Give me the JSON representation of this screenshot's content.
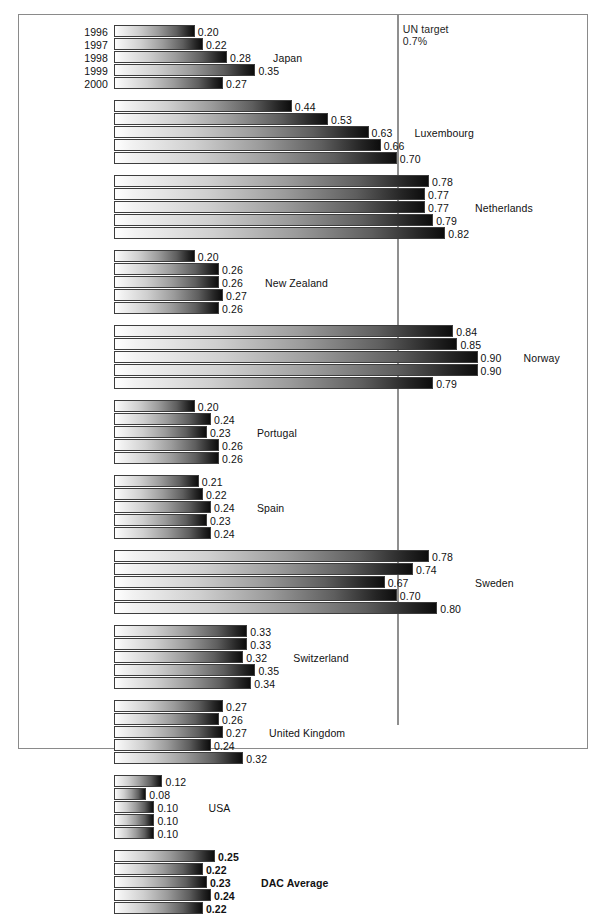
{
  "chart_data": {
    "type": "bar",
    "title": "",
    "xlabel": "",
    "ylabel": "",
    "orientation": "horizontal",
    "grid": false,
    "legend_position": "none",
    "xlim": [
      0,
      1.0
    ],
    "categories": [
      "1996",
      "1997",
      "1998",
      "1999",
      "2000"
    ],
    "reference_line": {
      "label": "UN target",
      "value_label": "0.7%",
      "value": 0.7
    },
    "series": [
      {
        "name": "Japan",
        "bold": false,
        "values": [
          0.2,
          0.22,
          0.28,
          0.35,
          0.27
        ]
      },
      {
        "name": "Luxembourg",
        "bold": false,
        "values": [
          0.44,
          0.53,
          0.63,
          0.66,
          0.7
        ]
      },
      {
        "name": "Netherlands",
        "bold": false,
        "values": [
          0.78,
          0.77,
          0.77,
          0.79,
          0.82
        ]
      },
      {
        "name": "New Zealand",
        "bold": false,
        "values": [
          0.2,
          0.26,
          0.26,
          0.27,
          0.26
        ]
      },
      {
        "name": "Norway",
        "bold": false,
        "values": [
          0.84,
          0.85,
          0.9,
          0.9,
          0.79
        ]
      },
      {
        "name": "Portugal",
        "bold": false,
        "values": [
          0.2,
          0.24,
          0.23,
          0.26,
          0.26
        ]
      },
      {
        "name": "Spain",
        "bold": false,
        "values": [
          0.21,
          0.22,
          0.24,
          0.23,
          0.24
        ]
      },
      {
        "name": "Sweden",
        "bold": false,
        "values": [
          0.78,
          0.74,
          0.67,
          0.7,
          0.8
        ]
      },
      {
        "name": "Switzerland",
        "bold": false,
        "values": [
          0.33,
          0.33,
          0.32,
          0.35,
          0.34
        ]
      },
      {
        "name": "United Kingdom",
        "bold": false,
        "values": [
          0.27,
          0.26,
          0.27,
          0.24,
          0.32
        ]
      },
      {
        "name": "USA",
        "bold": false,
        "values": [
          0.12,
          0.08,
          0.1,
          0.1,
          0.1
        ]
      },
      {
        "name": "DAC Average",
        "bold": true,
        "values": [
          0.25,
          0.22,
          0.23,
          0.24,
          0.22
        ]
      }
    ]
  },
  "axis": {
    "year_labels": [
      "1996",
      "1997",
      "1998",
      "1999",
      "2000"
    ]
  },
  "caption": {
    "text": ""
  },
  "colors": {
    "frame": "#8a8a8a",
    "target_line": "#8f8f8f",
    "bar_light": "#ffffff",
    "bar_dark": "#0d0d0d",
    "text": "#111111"
  },
  "layout": {
    "bar_origin_x": 95,
    "px_per_unit": 404,
    "bar_height": 12,
    "bar_gap": 1,
    "group_gap": 10,
    "first_bar_top": 10
  }
}
